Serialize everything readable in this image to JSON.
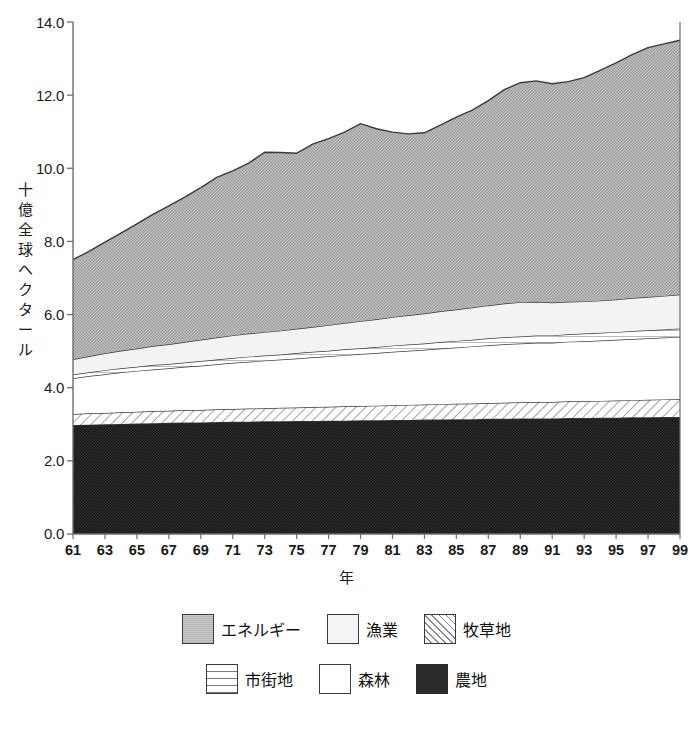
{
  "chart_data": {
    "type": "area",
    "stacked": true,
    "title": "",
    "xlabel": "年",
    "ylabel": "十億全球ヘクタール",
    "ylim": [
      0.0,
      14.0
    ],
    "yticks": [
      "0.0",
      "2.0",
      "4.0",
      "6.0",
      "8.0",
      "10.0",
      "12.0",
      "14.0"
    ],
    "ytick_values": [
      0.0,
      2.0,
      4.0,
      6.0,
      8.0,
      10.0,
      12.0,
      14.0
    ],
    "xlim": [
      1961,
      1999
    ],
    "xticks": [
      "61",
      "63",
      "65",
      "67",
      "69",
      "71",
      "73",
      "75",
      "77",
      "79",
      "81",
      "83",
      "85",
      "87",
      "89",
      "91",
      "93",
      "95",
      "97",
      "99"
    ],
    "x": [
      1961,
      1962,
      1963,
      1964,
      1965,
      1966,
      1967,
      1968,
      1969,
      1970,
      1971,
      1972,
      1973,
      1974,
      1975,
      1976,
      1977,
      1978,
      1979,
      1980,
      1981,
      1982,
      1983,
      1984,
      1985,
      1986,
      1987,
      1988,
      1989,
      1990,
      1991,
      1992,
      1993,
      1994,
      1995,
      1996,
      1997,
      1998,
      1999
    ],
    "grid": false,
    "legend_position": "bottom",
    "series": [
      {
        "name": "農地",
        "key": "cropland",
        "pattern": "solid-black",
        "color": "#2a2a2a",
        "values": [
          2.98,
          2.99,
          3.0,
          3.01,
          3.02,
          3.03,
          3.04,
          3.05,
          3.05,
          3.06,
          3.07,
          3.07,
          3.08,
          3.08,
          3.09,
          3.09,
          3.1,
          3.1,
          3.11,
          3.11,
          3.12,
          3.12,
          3.13,
          3.13,
          3.14,
          3.14,
          3.15,
          3.15,
          3.16,
          3.16,
          3.16,
          3.17,
          3.17,
          3.18,
          3.18,
          3.19,
          3.19,
          3.2,
          3.2
        ]
      },
      {
        "name": "牧草地",
        "key": "pasture",
        "pattern": "diagonal-hatch",
        "color": "#ffffff",
        "values": [
          0.3,
          0.31,
          0.31,
          0.32,
          0.32,
          0.33,
          0.33,
          0.34,
          0.34,
          0.35,
          0.35,
          0.36,
          0.36,
          0.37,
          0.37,
          0.38,
          0.38,
          0.39,
          0.39,
          0.4,
          0.4,
          0.41,
          0.41,
          0.42,
          0.42,
          0.43,
          0.43,
          0.44,
          0.44,
          0.45,
          0.45,
          0.46,
          0.46,
          0.46,
          0.47,
          0.47,
          0.48,
          0.48,
          0.49
        ]
      },
      {
        "name": "森林",
        "key": "forest",
        "pattern": "solid-white",
        "color": "#ffffff",
        "values": [
          0.98,
          1.02,
          1.06,
          1.09,
          1.12,
          1.14,
          1.16,
          1.18,
          1.21,
          1.23,
          1.26,
          1.28,
          1.3,
          1.32,
          1.34,
          1.36,
          1.38,
          1.4,
          1.42,
          1.44,
          1.46,
          1.48,
          1.5,
          1.52,
          1.54,
          1.56,
          1.58,
          1.6,
          1.61,
          1.62,
          1.62,
          1.63,
          1.64,
          1.65,
          1.66,
          1.67,
          1.68,
          1.69,
          1.7
        ]
      },
      {
        "name": "市街地",
        "key": "urban",
        "pattern": "horizontal-lines",
        "color": "#ffffff",
        "values": [
          0.1,
          0.1,
          0.11,
          0.11,
          0.11,
          0.12,
          0.12,
          0.12,
          0.13,
          0.13,
          0.13,
          0.14,
          0.14,
          0.14,
          0.15,
          0.15,
          0.15,
          0.16,
          0.16,
          0.16,
          0.17,
          0.17,
          0.17,
          0.18,
          0.18,
          0.18,
          0.19,
          0.19,
          0.19,
          0.2,
          0.2,
          0.2,
          0.21,
          0.21,
          0.21,
          0.22,
          0.22,
          0.22,
          0.23
        ]
      },
      {
        "name": "漁業",
        "key": "fisheries",
        "pattern": "light-gray",
        "color": "#f2f2f2",
        "values": [
          0.42,
          0.44,
          0.46,
          0.48,
          0.5,
          0.52,
          0.54,
          0.56,
          0.58,
          0.6,
          0.62,
          0.63,
          0.64,
          0.65,
          0.66,
          0.68,
          0.7,
          0.72,
          0.74,
          0.76,
          0.78,
          0.8,
          0.82,
          0.84,
          0.86,
          0.88,
          0.9,
          0.92,
          0.94,
          0.92,
          0.9,
          0.89,
          0.88,
          0.88,
          0.89,
          0.9,
          0.91,
          0.92,
          0.93
        ]
      },
      {
        "name": "エネルギー",
        "key": "energy",
        "pattern": "gray-fill",
        "color": "#b2b2b2",
        "values": [
          2.72,
          2.87,
          3.04,
          3.22,
          3.41,
          3.6,
          3.78,
          3.96,
          4.16,
          4.38,
          4.5,
          4.66,
          4.92,
          4.87,
          4.8,
          5.0,
          5.1,
          5.22,
          5.4,
          5.21,
          5.06,
          4.96,
          4.94,
          5.09,
          5.26,
          5.4,
          5.6,
          5.85,
          6.0,
          6.04,
          5.98,
          6.02,
          6.12,
          6.3,
          6.47,
          6.66,
          6.82,
          6.89,
          6.95
        ]
      }
    ],
    "totals": [
      7.5,
      7.73,
      7.98,
      8.23,
      8.48,
      8.74,
      8.97,
      9.21,
      9.47,
      9.75,
      9.93,
      10.14,
      10.44,
      10.43,
      10.41,
      10.66,
      10.81,
      10.99,
      11.22,
      11.08,
      10.99,
      10.94,
      10.97,
      11.18,
      11.4,
      11.59,
      11.85,
      12.15,
      12.34,
      12.39,
      12.31,
      12.37,
      12.48,
      12.68,
      12.88,
      13.11,
      13.3,
      13.4,
      13.5
    ]
  },
  "axis": {
    "y_title_chars": [
      "十",
      "億",
      "全",
      "球",
      "ヘ",
      "ク",
      "タ",
      "ー",
      "ル"
    ],
    "x_title": "年"
  },
  "legend": {
    "row1": [
      {
        "label": "エネルギー",
        "pattern": "gray-fill"
      },
      {
        "label": "漁業",
        "pattern": "light-gray"
      },
      {
        "label": "牧草地",
        "pattern": "diagonal-hatch"
      }
    ],
    "row2": [
      {
        "label": "市街地",
        "pattern": "horizontal-lines"
      },
      {
        "label": "森林",
        "pattern": "solid-white"
      },
      {
        "label": "農地",
        "pattern": "solid-black"
      }
    ]
  },
  "colors": {
    "energy": "#b2b2b2",
    "fisheries": "#f2f2f2",
    "pasture": "#ffffff",
    "urban": "#ffffff",
    "forest": "#ffffff",
    "cropland": "#2a2a2a",
    "axis": "#6e6e6e",
    "line": "#3a3a3a"
  }
}
